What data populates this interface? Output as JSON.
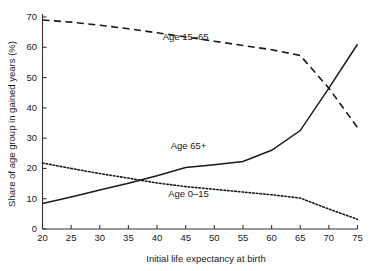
{
  "chart_data": {
    "type": "line",
    "title": "",
    "xlabel": "Initial life expectancy at birth",
    "ylabel": "Share of age group in gained years (%)",
    "xlim": [
      20,
      75
    ],
    "ylim": [
      0,
      70
    ],
    "xticks": [
      20,
      25,
      30,
      35,
      40,
      45,
      50,
      55,
      60,
      65,
      70,
      75
    ],
    "yticks": [
      0,
      10,
      20,
      30,
      40,
      50,
      60,
      70
    ],
    "grid": false,
    "legend_position": "inline-annotations",
    "x": [
      20,
      25,
      30,
      35,
      40,
      45,
      50,
      55,
      60,
      65,
      70,
      75
    ],
    "series": [
      {
        "name": "Age 15–65",
        "style": "dashed",
        "label": "Age 15–65",
        "label_x": 45,
        "label_y": 62.5,
        "values": [
          69.0,
          68.3,
          67.3,
          66.1,
          64.8,
          63.4,
          62.0,
          60.6,
          59.2,
          57.3,
          46.5,
          33.5
        ]
      },
      {
        "name": "Age 65+",
        "style": "solid",
        "label": "Age 65+",
        "label_x": 45.5,
        "label_y": 26.5,
        "values": [
          8.4,
          10.6,
          12.9,
          15.1,
          17.6,
          20.3,
          21.2,
          22.3,
          26.0,
          32.5,
          46.5,
          61.0
        ]
      },
      {
        "name": "Age 0–15",
        "style": "dotted",
        "label": "Age 0–15",
        "label_x": 45.5,
        "label_y": 10.5,
        "values": [
          21.8,
          20.0,
          18.3,
          16.8,
          15.2,
          14.0,
          13.1,
          12.2,
          11.3,
          10.2,
          6.6,
          3.2
        ]
      }
    ]
  },
  "colors": {
    "ink": "#1a1a1a",
    "axis": "#333333",
    "background": "#ffffff"
  }
}
